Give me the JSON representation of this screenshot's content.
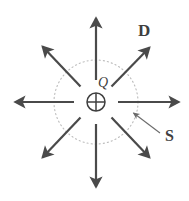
{
  "figure": {
    "background_color": "#ffffff",
    "labels": {
      "charge": "Q",
      "flux_density": "D",
      "surface": "S"
    },
    "colors": {
      "arrow": "#4a4a4a",
      "surface_dotted": "#bdbdbd",
      "charge_symbol": "#3f3f3f",
      "leader": "#6b6b6b",
      "text": "#3f3f3f"
    },
    "geometry": {
      "center": {
        "x": 96,
        "y": 102
      },
      "charge_radius": 9,
      "surface_radius": 42,
      "arrow_count": 8,
      "arrow_inner_radius": 22,
      "arrow_shaft_width": 2.2
    },
    "elements": {
      "charge_symbol_name": "circled-plus-symbol",
      "surface_name": "dotted-gaussian-surface",
      "leader_name": "surface-leader-arrow"
    },
    "arrows": [
      {
        "name": "flux-arrow-up",
        "angle_deg": 90,
        "tip": {
          "x": 96,
          "y": 15
        }
      },
      {
        "name": "flux-arrow-up-right",
        "angle_deg": 45,
        "tip": {
          "x": 152,
          "y": 45
        }
      },
      {
        "name": "flux-arrow-right",
        "angle_deg": 0,
        "tip": {
          "x": 182,
          "y": 102
        }
      },
      {
        "name": "flux-arrow-down-right",
        "angle_deg": -45,
        "tip": {
          "x": 152,
          "y": 160
        }
      },
      {
        "name": "flux-arrow-down",
        "angle_deg": -90,
        "tip": {
          "x": 96,
          "y": 190
        }
      },
      {
        "name": "flux-arrow-down-left",
        "angle_deg": -135,
        "tip": {
          "x": 40,
          "y": 160
        }
      },
      {
        "name": "flux-arrow-left",
        "angle_deg": 180,
        "tip": {
          "x": 12,
          "y": 102
        }
      },
      {
        "name": "flux-arrow-up-left",
        "angle_deg": 135,
        "tip": {
          "x": 40,
          "y": 44
        }
      }
    ]
  }
}
